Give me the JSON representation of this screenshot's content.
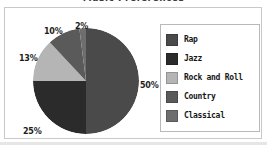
{
  "figure": {
    "title_fragment": "Music Preferences",
    "background": "#ffffff",
    "frame_color": "#c9c9c9"
  },
  "chart_data": {
    "type": "pie",
    "title": "",
    "xlabel": "",
    "ylabel": "",
    "legend_position": "right",
    "grid": false,
    "start_angle_deg": 0,
    "direction": "clockwise",
    "categories": [
      "Rap",
      "Jazz",
      "Rock and Roll",
      "Country",
      "Classical"
    ],
    "values": [
      50,
      25,
      13,
      10,
      2
    ],
    "value_labels": [
      "50%",
      "25%",
      "13%",
      "10%",
      "2%"
    ],
    "colors": [
      "#4a4a4a",
      "#2b2b2b",
      "#b5b5b5",
      "#5a5a5a",
      "#6e6e6e"
    ],
    "slices": [
      {
        "name": "Rap",
        "value": 50,
        "label": "50%",
        "color": "#4a4a4a"
      },
      {
        "name": "Jazz",
        "value": 25,
        "label": "25%",
        "color": "#2b2b2b"
      },
      {
        "name": "Rock and Roll",
        "value": 13,
        "label": "13%",
        "color": "#b5b5b5"
      },
      {
        "name": "Country",
        "value": 10,
        "label": "10%",
        "color": "#5a5a5a"
      },
      {
        "name": "Classical",
        "value": 2,
        "label": "2%",
        "color": "#6e6e6e"
      }
    ]
  },
  "legend": {
    "items": [
      {
        "label": "Rap",
        "color": "#4a4a4a"
      },
      {
        "label": "Jazz",
        "color": "#2b2b2b"
      },
      {
        "label": "Rock and Roll",
        "color": "#b5b5b5"
      },
      {
        "label": "Country",
        "color": "#5a5a5a"
      },
      {
        "label": "Classical",
        "color": "#6e6e6e"
      }
    ]
  }
}
